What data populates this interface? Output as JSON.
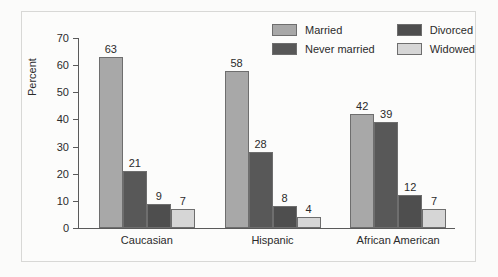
{
  "chart_data": {
    "type": "bar",
    "title": "",
    "xlabel": "",
    "ylabel": "Percent",
    "ylim": [
      0,
      70
    ],
    "yticks": [
      0,
      10,
      20,
      30,
      40,
      50,
      60,
      70
    ],
    "grid": false,
    "legend_position": "top-right",
    "categories": [
      "Caucasian",
      "Hispanic",
      "African American"
    ],
    "series": [
      {
        "name": "Married",
        "color": "#a8a8a8",
        "values": [
          63,
          58,
          42
        ]
      },
      {
        "name": "Never married",
        "color": "#585858",
        "values": [
          21,
          28,
          39
        ]
      },
      {
        "name": "Divorced",
        "color": "#4e4e4e",
        "values": [
          9,
          8,
          12
        ]
      },
      {
        "name": "Widowed",
        "color": "#d6d6d6",
        "values": [
          7,
          4,
          7
        ]
      }
    ],
    "legend_order": [
      "Married",
      "Divorced",
      "Never married",
      "Widowed"
    ]
  }
}
